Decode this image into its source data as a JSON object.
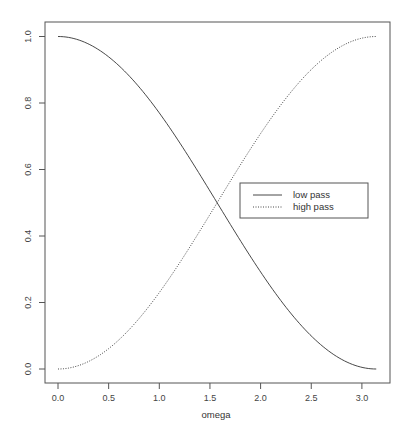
{
  "chart_data": {
    "type": "line",
    "title": "",
    "xlabel": "omega",
    "ylabel": "",
    "xlim": [
      0,
      3.1416
    ],
    "ylim": [
      0,
      1
    ],
    "grid": false,
    "legend_position": "center-right",
    "x_ticks": [
      "0.0",
      "0.5",
      "1.0",
      "1.5",
      "2.0",
      "2.5",
      "3.0"
    ],
    "y_ticks": [
      "0.0",
      "0.2",
      "0.4",
      "0.6",
      "0.8",
      "1.0"
    ],
    "x": [
      0.0,
      0.25,
      0.5,
      0.75,
      1.0,
      1.25,
      1.5,
      1.75,
      2.0,
      2.25,
      2.5,
      2.75,
      3.0,
      3.1416
    ],
    "series": [
      {
        "name": "low pass",
        "line_style": "solid",
        "values": [
          1.0,
          0.984,
          0.939,
          0.866,
          0.77,
          0.658,
          0.535,
          0.411,
          0.292,
          0.186,
          0.099,
          0.038,
          0.005,
          0.0
        ]
      },
      {
        "name": "high pass",
        "line_style": "dotted",
        "values": [
          0.0,
          0.016,
          0.061,
          0.134,
          0.23,
          0.342,
          0.465,
          0.589,
          0.708,
          0.814,
          0.901,
          0.962,
          0.995,
          1.0
        ]
      }
    ],
    "annotations": [
      "curves cross at omega ≈ 1.57, value 0.5"
    ]
  },
  "colors": {
    "axis": "#555555",
    "line": "#333333",
    "background": "#ffffff"
  }
}
